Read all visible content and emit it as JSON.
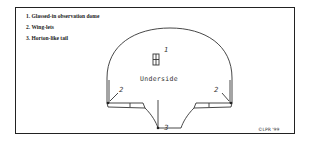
{
  "legend": {
    "items": [
      {
        "number": "1.",
        "label": "Glassed-in observation dome"
      },
      {
        "number": "2.",
        "label": "Wing-lets"
      },
      {
        "number": "3.",
        "label": "Horton-like tail"
      }
    ]
  },
  "drawing": {
    "view_label": "Underside",
    "callouts": {
      "dome": "1",
      "winglet_left": "2",
      "winglet_right": "2",
      "tail": "3"
    }
  },
  "signature": "©LPR '99"
}
